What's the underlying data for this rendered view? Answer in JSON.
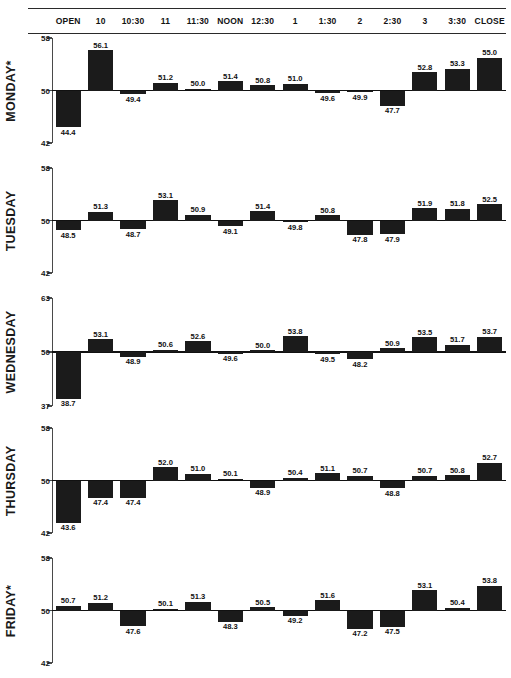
{
  "header": {
    "times": [
      "OPEN",
      "10",
      "10:30",
      "11",
      "11:30",
      "NOON",
      "12:30",
      "1",
      "1:30",
      "2",
      "2:30",
      "3",
      "3:30",
      "CLOSE"
    ]
  },
  "chart_data": {
    "type": "bar",
    "title": "",
    "xlabel": "",
    "ylabel": "",
    "grid": false,
    "legend": "none",
    "baseline": 50,
    "categories": [
      "OPEN",
      "10",
      "10:30",
      "11",
      "11:30",
      "NOON",
      "12:30",
      "1",
      "1:30",
      "2",
      "2:30",
      "3",
      "3:30",
      "CLOSE"
    ],
    "panels": [
      {
        "name": "MONDAY*",
        "ylim": [
          42,
          58
        ],
        "yticks": [
          42,
          50,
          58
        ],
        "ytick_labels": [
          "42",
          "50",
          "58"
        ],
        "values": [
          44.4,
          56.1,
          49.4,
          51.2,
          50.0,
          51.4,
          50.8,
          51.0,
          49.6,
          49.9,
          47.7,
          52.8,
          53.3,
          55.0
        ],
        "labels": [
          "44.4",
          "56.1",
          "49.4",
          "51.2",
          "50.0",
          "51.4",
          "50.8",
          "51.0",
          "49.6",
          "49.9",
          "47.7",
          "52.8",
          "53.3",
          "55.0"
        ]
      },
      {
        "name": "TUESDAY",
        "ylim": [
          42,
          58
        ],
        "yticks": [
          42,
          50,
          58
        ],
        "ytick_labels": [
          "42",
          "50",
          "58"
        ],
        "values": [
          48.5,
          51.3,
          48.7,
          53.1,
          50.9,
          49.1,
          51.4,
          49.8,
          50.8,
          47.8,
          47.9,
          51.9,
          51.8,
          52.5
        ],
        "labels": [
          "48.5",
          "51.3",
          "48.7",
          "53.1",
          "50.9",
          "49.1",
          "51.4",
          "49.8",
          "50.8",
          "47.8",
          "47.9",
          "51.9",
          "51.8",
          "52.5"
        ]
      },
      {
        "name": "WEDNESDAY",
        "ylim": [
          37,
          63
        ],
        "yticks": [
          37,
          50,
          63
        ],
        "ytick_labels": [
          "37",
          "50",
          "63"
        ],
        "values": [
          38.7,
          53.1,
          48.9,
          50.6,
          52.6,
          49.6,
          50.0,
          53.8,
          49.5,
          48.2,
          50.9,
          53.5,
          51.7,
          53.7
        ],
        "labels": [
          "38.7",
          "53.1",
          "48.9",
          "50.6",
          "52.6",
          "49.6",
          "50.0",
          "53.8",
          "49.5",
          "48.2",
          "50.9",
          "53.5",
          "51.7",
          "53.7"
        ]
      },
      {
        "name": "THURSDAY",
        "ylim": [
          42,
          58
        ],
        "yticks": [
          42,
          50,
          58
        ],
        "ytick_labels": [
          "42",
          "50",
          "58"
        ],
        "values": [
          43.6,
          47.4,
          47.4,
          52.0,
          51.0,
          50.1,
          48.9,
          50.4,
          51.1,
          50.7,
          48.8,
          50.7,
          50.8,
          52.7
        ],
        "labels": [
          "43.6",
          "47.4",
          "47.4",
          "52.0",
          "51.0",
          "50.1",
          "48.9",
          "50.4",
          "51.1",
          "50.7",
          "48.8",
          "50.7",
          "50.8",
          "52.7"
        ]
      },
      {
        "name": "FRIDAY*",
        "ylim": [
          42,
          58
        ],
        "yticks": [
          42,
          50,
          58
        ],
        "ytick_labels": [
          "42",
          "50",
          "58"
        ],
        "values": [
          50.7,
          51.2,
          47.6,
          50.1,
          51.3,
          48.3,
          50.5,
          49.2,
          51.6,
          47.2,
          47.5,
          53.1,
          50.4,
          53.8
        ],
        "labels": [
          "50.7",
          "51.2",
          "47.6",
          "50.1",
          "51.3",
          "48.3",
          "50.5",
          "49.2",
          "51.6",
          "47.2",
          "47.5",
          "53.1",
          "50.4",
          "53.8"
        ]
      }
    ]
  },
  "style": {
    "bar_color": "#1b1b1b",
    "axis_color": "#4a4a4a",
    "text_color": "#111111"
  }
}
